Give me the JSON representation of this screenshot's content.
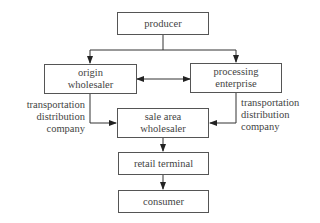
{
  "diagram": {
    "type": "flowchart",
    "nodes": {
      "producer": "producer",
      "origin_wholesaler": "origin wholesaler",
      "processing_enterprise": "processing enterprise",
      "sale_area_wholesaler": "sale area wholesaler",
      "retail_terminal": "retail terminal",
      "consumer": "consumer"
    },
    "node_lines": {
      "origin_wholesaler": [
        "origin",
        "wholesaler"
      ],
      "processing_enterprise": [
        "processing",
        "enterprise"
      ],
      "sale_area_wholesaler": [
        "sale area",
        "wholesaler"
      ]
    },
    "edge_labels": {
      "left": [
        "transportation",
        "distribution",
        "company"
      ],
      "right": [
        "transportation",
        "distribution",
        "company"
      ]
    },
    "edges": [
      {
        "from": "producer",
        "to": "origin_wholesaler"
      },
      {
        "from": "producer",
        "to": "processing_enterprise"
      },
      {
        "from": "origin_wholesaler",
        "to": "processing_enterprise",
        "bidirectional": true
      },
      {
        "from": "origin_wholesaler",
        "to": "sale_area_wholesaler",
        "label": "transportation distribution company"
      },
      {
        "from": "processing_enterprise",
        "to": "sale_area_wholesaler",
        "label": "transportation distribution company"
      },
      {
        "from": "sale_area_wholesaler",
        "to": "retail_terminal"
      },
      {
        "from": "retail_terminal",
        "to": "consumer"
      }
    ],
    "colors": {
      "line": "#333333",
      "box_border": "#555555",
      "text": "#444444",
      "background": "#ffffff"
    }
  }
}
